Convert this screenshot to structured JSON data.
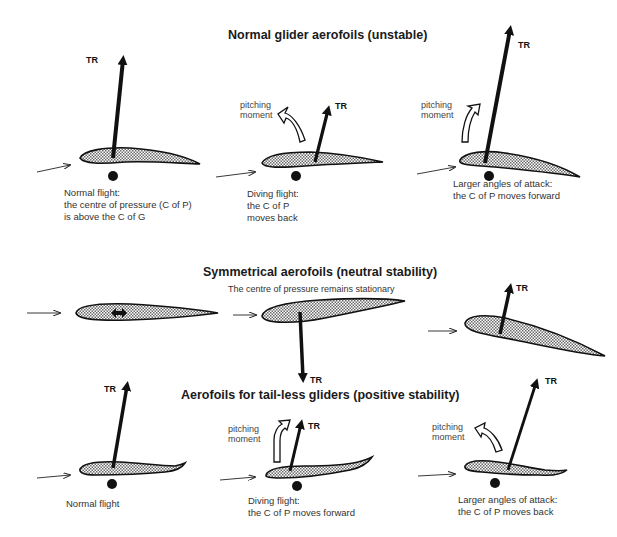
{
  "sections": [
    {
      "title": "Normal glider aerofoils (unstable)",
      "panels": [
        {
          "caption_lines": [
            "Normal flight:",
            "the centre of pressure (C of P)",
            "is above the C of G"
          ],
          "force_label": "TR"
        },
        {
          "caption_lines": [
            "Diving flight:",
            "the C of P",
            "moves back"
          ],
          "force_label": "TR",
          "moment_label": [
            "pitching",
            "moment"
          ]
        },
        {
          "caption_lines": [
            "Larger angles of attack:",
            "the C of P moves forward"
          ],
          "force_label": "TR",
          "moment_label": [
            "pitching",
            "moment"
          ]
        }
      ]
    },
    {
      "title": "Symmetrical aerofoils (neutral stability)",
      "note": "The centre of pressure remains stationary",
      "panels": [
        {
          "force_label": ""
        },
        {
          "force_label": "TR"
        },
        {
          "force_label": "TR"
        }
      ]
    },
    {
      "title": "Aerofoils for tail-less gliders (positive stability)",
      "panels": [
        {
          "caption_lines": [
            "Normal flight"
          ],
          "force_label": "TR"
        },
        {
          "caption_lines": [
            "Diving flight:",
            "the C of P moves forward"
          ],
          "force_label": "TR",
          "moment_label": [
            "pitching",
            "moment"
          ]
        },
        {
          "caption_lines": [
            "Larger angles of attack:",
            "the C of P moves back"
          ],
          "force_label": "TR",
          "moment_label": [
            "pitching",
            "moment"
          ]
        }
      ]
    }
  ],
  "colors": {
    "ink": "#111111",
    "fill_pattern": "#9a9a9a",
    "background": "#ffffff"
  }
}
